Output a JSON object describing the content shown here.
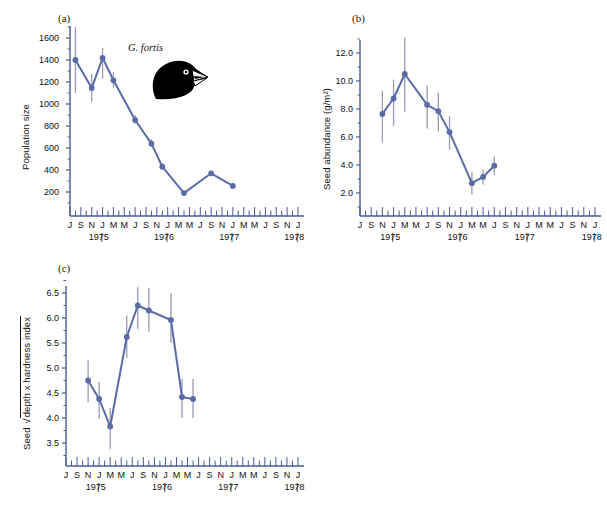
{
  "figure": {
    "species_label": "G. fortis",
    "bird_icon": "finch-head-silhouette",
    "accent_color": "#5a6ba6",
    "errorbar_color": "#9a9ab4",
    "axis_color": "#4a5a96"
  },
  "panels": {
    "a": {
      "label": "(a)",
      "ylabel": "Population size",
      "yticks": [
        "1600",
        "1400",
        "1200",
        "1000",
        "800",
        "600",
        "400",
        "200"
      ]
    },
    "b": {
      "label": "(b)",
      "ylabel": "Seed abundance (g/m²)",
      "yticks": [
        "12.0",
        "10.0",
        "8.0",
        "6.0",
        "4.0",
        "2.0"
      ]
    },
    "c": {
      "label": "(c)",
      "ylabel_prefix": "Seed",
      "ylabel_radicand": "depth x hardness index",
      "ylabel_full": "Seed √depth x hardness index",
      "yticks": [
        "6.5",
        "6.0",
        "5.5",
        "5.0",
        "4.5",
        "4.0",
        "3.5"
      ]
    }
  },
  "xaxis": {
    "month_labels": [
      "J",
      "S",
      "N",
      "J",
      "M",
      "M",
      "J",
      "S",
      "N",
      "J",
      "M",
      "M",
      "J",
      "S",
      "N",
      "J",
      "M",
      "M",
      "J",
      "S",
      "N",
      "J"
    ],
    "year_labels": [
      "1975",
      "1976",
      "1977",
      "1978"
    ],
    "year_divider": "|",
    "tick_count": 43
  },
  "chart_data": [
    {
      "type": "line",
      "title": "(a)",
      "xlabel": "",
      "ylabel": "Population size",
      "ylim": [
        100,
        1700
      ],
      "yticks": [
        1600,
        1400,
        1200,
        1000,
        800,
        600,
        400,
        200
      ],
      "grid": false,
      "legend": "none",
      "x_labels": [
        "Jul 1975",
        "Jan 1976",
        "Mar 1976",
        "Jun 1976",
        "Dec 1976",
        "Mar 1977",
        "Jun 1977",
        "Dec 1977",
        "Jun 1978",
        "Jan 1979"
      ],
      "x_positions": [
        1,
        4,
        6,
        8,
        12,
        15,
        17,
        21,
        26,
        30
      ],
      "values": [
        1400,
        1145,
        1420,
        1215,
        855,
        640,
        430,
        190,
        370,
        255
      ],
      "err_low": [
        1100,
        1020,
        1230,
        1150,
        820,
        610,
        405,
        175,
        350,
        240
      ],
      "err_high": [
        1700,
        1270,
        1510,
        1290,
        900,
        680,
        460,
        205,
        390,
        275
      ]
    },
    {
      "type": "line",
      "title": "(b)",
      "xlabel": "",
      "ylabel": "Seed abundance (g/m²)",
      "ylim": [
        1.2,
        13.2
      ],
      "yticks": [
        12.0,
        10.0,
        8.0,
        6.0,
        4.0,
        2.0
      ],
      "grid": false,
      "legend": "none",
      "x_labels": [
        "Jan 1976",
        "Mar 1976",
        "Jun 1976",
        "Jan 1977",
        "Mar 1977",
        "Jun 1977",
        "Jan 1978",
        "Apr 1978",
        "Jun 1978"
      ],
      "x_positions": [
        4,
        6,
        8,
        12,
        14,
        16,
        20,
        22,
        24
      ],
      "values": [
        7.65,
        8.75,
        10.5,
        8.3,
        7.85,
        6.35,
        2.7,
        3.15,
        3.95
      ],
      "err_low": [
        5.6,
        6.8,
        7.8,
        6.6,
        6.4,
        5.1,
        1.9,
        2.6,
        3.3
      ],
      "err_high": [
        9.3,
        10.1,
        13.1,
        9.7,
        9.15,
        7.5,
        3.5,
        3.7,
        4.6
      ]
    },
    {
      "type": "line",
      "title": "(c)",
      "xlabel": "",
      "ylabel": "Seed √depth x hardness index",
      "ylim": [
        3.35,
        6.65
      ],
      "yticks": [
        6.5,
        6.0,
        5.5,
        5.0,
        4.5,
        4.0,
        3.5
      ],
      "grid": false,
      "legend": "none",
      "x_labels": [
        "Jan 1976",
        "Mar 1976",
        "Jun 1976",
        "Dec 1976",
        "Mar 1977",
        "May 1977",
        "Jan 1978",
        "Apr 1978",
        "Jun 1978"
      ],
      "x_positions": [
        4,
        6,
        8,
        11,
        13,
        15,
        19,
        21,
        23
      ],
      "values": [
        4.75,
        4.38,
        3.83,
        5.62,
        6.25,
        6.15,
        5.96,
        4.42,
        4.38
      ],
      "err_low": [
        4.32,
        3.98,
        3.38,
        5.2,
        5.78,
        5.72,
        5.5,
        4.0,
        4.0
      ],
      "err_high": [
        5.15,
        4.72,
        4.2,
        6.05,
        6.62,
        6.6,
        6.5,
        4.78,
        4.78
      ]
    }
  ]
}
